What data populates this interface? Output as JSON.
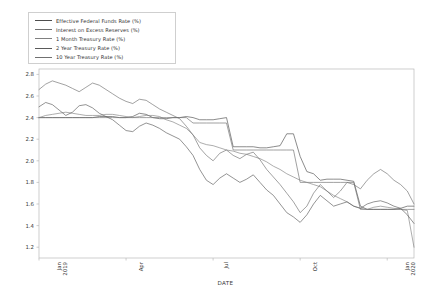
{
  "chart_data": {
    "type": "line",
    "title": "",
    "xlabel": "DATE",
    "ylabel": "",
    "ylim": [
      1.1,
      2.85
    ],
    "yticks": [
      1.2,
      1.4,
      1.6,
      1.8,
      2.0,
      2.2,
      2.4,
      2.6,
      2.8
    ],
    "ytick_labels": [
      "1.2",
      "1.4",
      "1.6",
      "1.8",
      "2.0",
      "2.2",
      "2.4",
      "2.6",
      "2.8"
    ],
    "xlim": [
      0,
      56
    ],
    "xticks": [
      0,
      13,
      26,
      39,
      52
    ],
    "xtick_labels": [
      "Jan\n2019",
      "Apr",
      "Jul",
      "Oct",
      "Jan\n2020"
    ],
    "grid": false,
    "legend_position": "upper-left",
    "series": [
      {
        "name": "Effective Federal Funds Rate (%)",
        "color": "#4d4d4d",
        "values": [
          2.4,
          2.4,
          2.4,
          2.4,
          2.4,
          2.4,
          2.4,
          2.4,
          2.4,
          2.41,
          2.41,
          2.41,
          2.4,
          2.4,
          2.41,
          2.44,
          2.43,
          2.4,
          2.39,
          2.39,
          2.4,
          2.4,
          2.41,
          2.4,
          2.38,
          2.38,
          2.38,
          2.39,
          2.4,
          2.13,
          2.13,
          2.13,
          2.13,
          2.12,
          2.12,
          2.13,
          2.14,
          2.25,
          2.25,
          2.04,
          1.9,
          1.88,
          1.82,
          1.83,
          1.83,
          1.83,
          1.82,
          1.81,
          1.58,
          1.55,
          1.55,
          1.55,
          1.55,
          1.55,
          1.56,
          1.58,
          1.58
        ]
      },
      {
        "name": "Interest on Excess Reserves (%)",
        "color": "#6e6e6e",
        "values": [
          2.4,
          2.4,
          2.4,
          2.4,
          2.4,
          2.4,
          2.4,
          2.4,
          2.4,
          2.4,
          2.4,
          2.4,
          2.4,
          2.4,
          2.4,
          2.4,
          2.4,
          2.4,
          2.4,
          2.4,
          2.4,
          2.4,
          2.4,
          2.35,
          2.35,
          2.35,
          2.35,
          2.35,
          2.35,
          2.1,
          2.1,
          2.1,
          2.1,
          2.1,
          2.1,
          2.1,
          2.1,
          2.1,
          2.1,
          1.8,
          1.8,
          1.8,
          1.8,
          1.8,
          1.8,
          1.8,
          1.8,
          1.8,
          1.55,
          1.55,
          1.55,
          1.55,
          1.55,
          1.55,
          1.55,
          1.55,
          1.55
        ]
      },
      {
        "name": "1 Month Treasury Rate (%)",
        "color": "#808080",
        "values": [
          2.4,
          2.42,
          2.43,
          2.44,
          2.45,
          2.44,
          2.43,
          2.42,
          2.42,
          2.42,
          2.43,
          2.43,
          2.42,
          2.41,
          2.4,
          2.41,
          2.42,
          2.42,
          2.41,
          2.38,
          2.36,
          2.33,
          2.3,
          2.24,
          2.17,
          2.15,
          2.14,
          2.12,
          2.1,
          2.09,
          2.07,
          2.06,
          2.04,
          2.02,
          1.99,
          1.95,
          1.92,
          1.88,
          1.85,
          1.82,
          1.8,
          1.78,
          1.76,
          1.72,
          1.68,
          1.65,
          1.62,
          1.58,
          1.56,
          1.55,
          1.57,
          1.58,
          1.57,
          1.56,
          1.55,
          1.54,
          1.2
        ]
      },
      {
        "name": "2 Year Treasury Rate (%)",
        "color": "#5a5a5a",
        "values": [
          2.5,
          2.54,
          2.52,
          2.47,
          2.42,
          2.45,
          2.51,
          2.52,
          2.49,
          2.44,
          2.41,
          2.38,
          2.33,
          2.28,
          2.27,
          2.32,
          2.35,
          2.33,
          2.3,
          2.26,
          2.23,
          2.2,
          2.13,
          2.05,
          1.92,
          1.82,
          1.78,
          1.84,
          1.88,
          1.84,
          1.8,
          1.83,
          1.87,
          1.8,
          1.73,
          1.68,
          1.6,
          1.52,
          1.48,
          1.43,
          1.5,
          1.6,
          1.68,
          1.63,
          1.58,
          1.6,
          1.62,
          1.58,
          1.56,
          1.6,
          1.62,
          1.63,
          1.61,
          1.58,
          1.56,
          1.5,
          1.42
        ]
      },
      {
        "name": "10 Year Treasury Rate (%)",
        "color": "#707070",
        "values": [
          2.66,
          2.71,
          2.74,
          2.72,
          2.7,
          2.67,
          2.64,
          2.68,
          2.72,
          2.7,
          2.66,
          2.62,
          2.58,
          2.55,
          2.53,
          2.57,
          2.56,
          2.52,
          2.48,
          2.45,
          2.42,
          2.39,
          2.32,
          2.24,
          2.12,
          2.05,
          2.0,
          2.07,
          2.1,
          2.05,
          2.02,
          2.06,
          2.08,
          2.01,
          1.92,
          1.85,
          1.78,
          1.7,
          1.62,
          1.52,
          1.58,
          1.7,
          1.78,
          1.72,
          1.66,
          1.72,
          1.8,
          1.78,
          1.74,
          1.82,
          1.88,
          1.92,
          1.88,
          1.82,
          1.78,
          1.72,
          1.6
        ]
      }
    ]
  },
  "axis": {
    "xlabel": "DATE"
  }
}
